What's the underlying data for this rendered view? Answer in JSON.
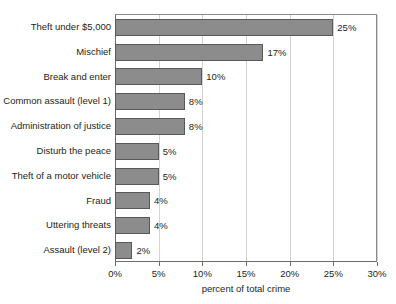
{
  "chart_data": {
    "type": "bar",
    "orientation": "horizontal",
    "title": "",
    "xlabel": "percent of total crime",
    "ylabel": "",
    "xlim": [
      0,
      30
    ],
    "xticks": [
      "0%",
      "5%",
      "10%",
      "15%",
      "20%",
      "25%",
      "30%"
    ],
    "xtick_values": [
      0,
      5,
      10,
      15,
      20,
      25,
      30
    ],
    "grid": true,
    "legend": false,
    "categories": [
      "Theft under $5,000",
      "Mischief",
      "Break and enter",
      "Common assault (level 1)",
      "Administration of justice",
      "Disturb the peace",
      "Theft of a motor vehicle",
      "Fraud",
      "Uttering threats",
      "Assault (level 2)"
    ],
    "values": [
      25,
      17,
      10,
      8,
      8,
      5,
      5,
      4,
      4,
      2
    ],
    "value_labels": [
      "25%",
      "17%",
      "10%",
      "8%",
      "8%",
      "5%",
      "5%",
      "4%",
      "4%",
      "2%"
    ],
    "bar_color": "#8c8c8c",
    "bar_border_color": "#58595b",
    "grid_color": "#d3d3d3",
    "axis_color": "#6e6e6e",
    "text_color": "#231f20",
    "background": "#ffffff"
  }
}
